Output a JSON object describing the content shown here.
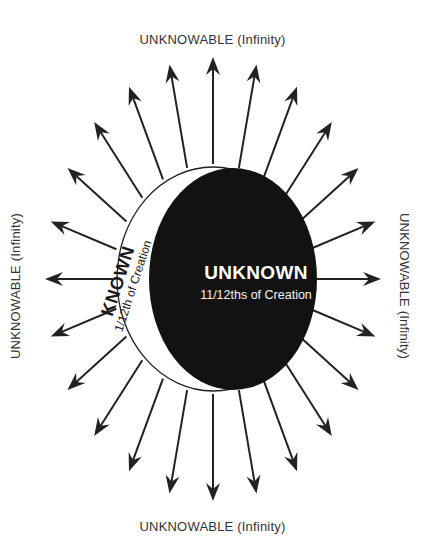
{
  "labels": {
    "top": "UNKNOWABLE (Infinity)",
    "bottom": "UNKNOWABLE (Infinity)",
    "left": "UNKNOWABLE (Infinity)",
    "right": "UNKNOWABLE (Infinity)"
  },
  "unknown": {
    "title": "UNKNOWN",
    "subtitle": "11/12ths of Creation"
  },
  "known": {
    "title": "KNOWN",
    "subtitle": "1/12th of Creation"
  },
  "diagram": {
    "arrow_count": 24,
    "colors": {
      "arrow": "#222222",
      "unknown_fill": "#111111",
      "known_fill": "#ffffff",
      "outline": "#222222",
      "label_text": "#333333"
    }
  }
}
